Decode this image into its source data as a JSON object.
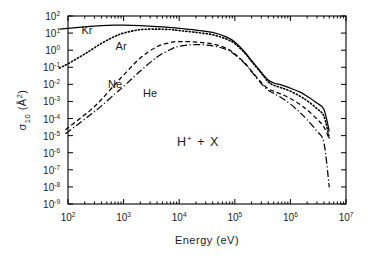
{
  "chart_data": {
    "type": "line",
    "title": "",
    "xlabel": "Energy (eV)",
    "ylabel": "σ₁₀ (Å²)",
    "xscale": "log",
    "yscale": "log",
    "xlim": [
      100,
      10000000
    ],
    "ylim": [
      1e-09,
      100
    ],
    "grid": false,
    "legend_position": "inline-labels",
    "annotation": "H+ + X",
    "annotation_parts": {
      "base": "H",
      "sup": "+",
      "rest": "+ X"
    },
    "xticks": [
      {
        "value": 100,
        "mantissa": "10",
        "exponent": "2"
      },
      {
        "value": 1000,
        "mantissa": "10",
        "exponent": "3"
      },
      {
        "value": 10000,
        "mantissa": "10",
        "exponent": "4"
      },
      {
        "value": 100000,
        "mantissa": "10",
        "exponent": "5"
      },
      {
        "value": 1000000,
        "mantissa": "10",
        "exponent": "6"
      },
      {
        "value": 10000000,
        "mantissa": "10",
        "exponent": "7"
      }
    ],
    "yticks": [
      {
        "value": 100,
        "mantissa": "10",
        "exponent": "2"
      },
      {
        "value": 10,
        "mantissa": "10",
        "exponent": "1"
      },
      {
        "value": 1,
        "mantissa": "10",
        "exponent": "0"
      },
      {
        "value": 0.1,
        "mantissa": "10",
        "exponent": "-1"
      },
      {
        "value": 0.01,
        "mantissa": "10",
        "exponent": "-2"
      },
      {
        "value": 0.001,
        "mantissa": "10",
        "exponent": "-3"
      },
      {
        "value": 0.0001,
        "mantissa": "10",
        "exponent": "-4"
      },
      {
        "value": 1e-05,
        "mantissa": "10",
        "exponent": "-5"
      },
      {
        "value": 1e-06,
        "mantissa": "10",
        "exponent": "-6"
      },
      {
        "value": 1e-07,
        "mantissa": "10",
        "exponent": "-7"
      },
      {
        "value": 1e-08,
        "mantissa": "10",
        "exponent": "-8"
      },
      {
        "value": 1e-09,
        "mantissa": "10",
        "exponent": "-9"
      }
    ],
    "series": [
      {
        "name": "Kr",
        "linestyle": "solid",
        "dasharray": "",
        "label_x": 220,
        "label_y": 9.0,
        "points": [
          [
            70,
            17
          ],
          [
            100,
            19
          ],
          [
            200,
            23
          ],
          [
            400,
            27
          ],
          [
            700,
            29
          ],
          [
            1000,
            29
          ],
          [
            2000,
            27
          ],
          [
            4000,
            24
          ],
          [
            7000,
            21
          ],
          [
            10000,
            19
          ],
          [
            20000,
            15
          ],
          [
            40000,
            11
          ],
          [
            70000,
            6.0
          ],
          [
            100000,
            3.0
          ],
          [
            150000,
            0.8
          ],
          [
            200000,
            0.25
          ],
          [
            300000,
            0.05
          ],
          [
            400000,
            0.018
          ],
          [
            500000,
            0.012
          ],
          [
            700000,
            0.009
          ],
          [
            1000000,
            0.006
          ],
          [
            1500000,
            0.0035
          ],
          [
            2000000,
            0.002
          ],
          [
            3000000,
            0.0008
          ],
          [
            4000000,
            0.00035
          ],
          [
            5000000,
            1.8e-05
          ]
        ]
      },
      {
        "name": "Ar",
        "linestyle": "dotted",
        "dasharray": "1.2,2.2",
        "label_x": 900,
        "label_y": 1.0,
        "points": [
          [
            70,
            0.09
          ],
          [
            100,
            0.16
          ],
          [
            200,
            0.6
          ],
          [
            400,
            2.5
          ],
          [
            700,
            6.5
          ],
          [
            1000,
            10
          ],
          [
            2000,
            16
          ],
          [
            4000,
            17
          ],
          [
            7000,
            16
          ],
          [
            10000,
            14
          ],
          [
            20000,
            11
          ],
          [
            40000,
            8.0
          ],
          [
            70000,
            4.5
          ],
          [
            100000,
            2.4
          ],
          [
            150000,
            0.7
          ],
          [
            200000,
            0.22
          ],
          [
            300000,
            0.045
          ],
          [
            400000,
            0.014
          ],
          [
            500000,
            0.009
          ],
          [
            700000,
            0.0062
          ],
          [
            1000000,
            0.004
          ],
          [
            1500000,
            0.002
          ],
          [
            2000000,
            0.0011
          ],
          [
            3000000,
            0.00038
          ],
          [
            4000000,
            0.00014
          ],
          [
            5000000,
            7.5e-06
          ]
        ]
      },
      {
        "name": "Ne",
        "linestyle": "dashed",
        "dasharray": "4.5,2.8",
        "label_x": 700,
        "label_y": 0.006,
        "points": [
          [
            90,
            2.2e-05
          ],
          [
            150,
            8e-05
          ],
          [
            250,
            0.0003
          ],
          [
            400,
            0.0013
          ],
          [
            700,
            0.01
          ],
          [
            1000,
            0.035
          ],
          [
            2000,
            0.35
          ],
          [
            4000,
            1.6
          ],
          [
            7000,
            2.8
          ],
          [
            10000,
            3.2
          ],
          [
            20000,
            3.0
          ],
          [
            40000,
            2.3
          ],
          [
            70000,
            1.3
          ],
          [
            100000,
            0.6
          ],
          [
            150000,
            0.18
          ],
          [
            200000,
            0.06
          ],
          [
            300000,
            0.013
          ],
          [
            400000,
            0.0055
          ],
          [
            500000,
            0.004
          ],
          [
            700000,
            0.0026
          ],
          [
            1000000,
            0.0015
          ],
          [
            1500000,
            0.00065
          ],
          [
            2000000,
            0.00032
          ],
          [
            3000000,
            9.5e-05
          ],
          [
            4000000,
            3.2e-05
          ],
          [
            5000000,
            6.5e-06
          ]
        ]
      },
      {
        "name": "He",
        "linestyle": "dashdot",
        "dasharray": "7,2.5,1.2,2.5",
        "label_x": 3000,
        "label_y": 0.0018,
        "points": [
          [
            90,
            1.3e-05
          ],
          [
            150,
            4.5e-05
          ],
          [
            250,
            0.00016
          ],
          [
            400,
            0.00055
          ],
          [
            700,
            0.0028
          ],
          [
            1000,
            0.0075
          ],
          [
            2000,
            0.06
          ],
          [
            4000,
            0.4
          ],
          [
            7000,
            1.1
          ],
          [
            10000,
            1.7
          ],
          [
            20000,
            2.1
          ],
          [
            40000,
            1.8
          ],
          [
            70000,
            1.1
          ],
          [
            100000,
            0.55
          ],
          [
            150000,
            0.17
          ],
          [
            200000,
            0.055
          ],
          [
            300000,
            0.011
          ],
          [
            400000,
            0.0045
          ],
          [
            500000,
            0.003
          ],
          [
            700000,
            0.0016
          ],
          [
            1000000,
            0.0007
          ],
          [
            1500000,
            0.00022
          ],
          [
            2000000,
            8.5e-05
          ],
          [
            3000000,
            1.8e-05
          ],
          [
            4000000,
            4e-06
          ],
          [
            5000000,
            9.5e-09
          ]
        ]
      }
    ]
  }
}
